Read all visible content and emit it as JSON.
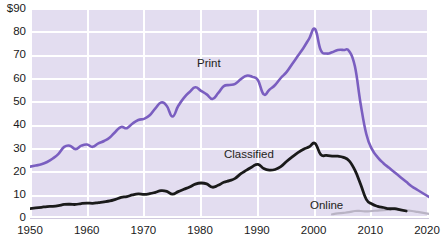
{
  "chart": {
    "title": "",
    "background_color": "#e3ddf0",
    "grid_color": "#ffffff",
    "plot": {
      "left": 30,
      "top": 8,
      "width": 399,
      "height": 210
    }
  },
  "axes": {
    "y_ticks": [
      "$90",
      "80",
      "70",
      "60",
      "50",
      "40",
      "30",
      "20",
      "10",
      "0"
    ],
    "y_values": [
      90,
      80,
      70,
      60,
      50,
      40,
      30,
      20,
      10,
      0
    ],
    "x_ticks": [
      "1950",
      "1960",
      "1970",
      "1980",
      "1990",
      "2000",
      "2010",
      "2020"
    ],
    "x_values": [
      1950,
      1960,
      1970,
      1980,
      1990,
      2000,
      2010,
      2020
    ]
  },
  "annotations": {
    "print": {
      "text": "Print",
      "x": 197,
      "y": 57
    },
    "classified": {
      "text": "Classified",
      "x": 224,
      "y": 148
    },
    "online": {
      "text": "Online",
      "x": 310,
      "y": 199
    }
  },
  "colors": {
    "print": "#7a5ec0",
    "classified": "#1a1a1a",
    "online": "#b9b3c4",
    "background": "#e3ddf0",
    "grid": "#ffffff",
    "text": "#1a1a1a"
  },
  "chart_data": {
    "type": "line",
    "title": "",
    "subtitle": "",
    "xlabel": "",
    "ylabel": "",
    "xlim": [
      1950,
      2020
    ],
    "ylim": [
      0,
      90
    ],
    "grid": true,
    "legend": "inline-labels",
    "y_tick_labels": [
      "$90",
      "80",
      "70",
      "60",
      "50",
      "40",
      "30",
      "20",
      "10",
      "0"
    ],
    "x_tick_labels": [
      "1950",
      "1960",
      "1970",
      "1980",
      "1990",
      "2000",
      "2010",
      "2020"
    ],
    "series": [
      {
        "name": "Print",
        "color": "#7a5ec0",
        "x": [
          1950,
          1951,
          1952,
          1953,
          1954,
          1955,
          1956,
          1957,
          1958,
          1959,
          1960,
          1961,
          1962,
          1963,
          1964,
          1965,
          1966,
          1967,
          1968,
          1969,
          1970,
          1971,
          1972,
          1973,
          1974,
          1975,
          1976,
          1977,
          1978,
          1979,
          1980,
          1981,
          1982,
          1983,
          1984,
          1985,
          1986,
          1987,
          1988,
          1989,
          1990,
          1991,
          1992,
          1993,
          1994,
          1995,
          1996,
          1997,
          1998,
          1999,
          2000,
          2001,
          2002,
          2003,
          2004,
          2005,
          2006,
          2007,
          2008,
          2009,
          2010,
          2011,
          2012,
          2013,
          2014,
          2015,
          2016,
          2017,
          2018,
          2019,
          2020
        ],
        "values": [
          22,
          22.5,
          23,
          24,
          25.5,
          27.5,
          30.5,
          31,
          29.5,
          31,
          31.5,
          30.5,
          32,
          33,
          34.5,
          37,
          39,
          38.5,
          40.5,
          42,
          42.5,
          44,
          47,
          49.5,
          48,
          43.5,
          48,
          51.5,
          54,
          56,
          54.5,
          53,
          51,
          53.5,
          56.5,
          57,
          57.5,
          59.5,
          61,
          60.5,
          59,
          53,
          55,
          57,
          60,
          62.5,
          66,
          69.5,
          73,
          77,
          81,
          72,
          70.5,
          71,
          72,
          72,
          71.5,
          65,
          49,
          36,
          29.5,
          26,
          23.5,
          21.5,
          19.5,
          17.5,
          15.5,
          13.5,
          12,
          10.5,
          9
        ]
      },
      {
        "name": "Classified",
        "color": "#1a1a1a",
        "x": [
          1950,
          1951,
          1952,
          1953,
          1954,
          1955,
          1956,
          1957,
          1958,
          1959,
          1960,
          1961,
          1962,
          1963,
          1964,
          1965,
          1966,
          1967,
          1968,
          1969,
          1970,
          1971,
          1972,
          1973,
          1974,
          1975,
          1976,
          1977,
          1978,
          1979,
          1980,
          1981,
          1982,
          1983,
          1984,
          1985,
          1986,
          1987,
          1988,
          1989,
          1990,
          1991,
          1992,
          1993,
          1994,
          1995,
          1996,
          1997,
          1998,
          1999,
          2000,
          2001,
          2002,
          2003,
          2004,
          2005,
          2006,
          2007,
          2008,
          2009,
          2010,
          2011,
          2012,
          2013,
          2014,
          2015,
          2016
        ],
        "values": [
          4,
          4.3,
          4.6,
          4.9,
          5,
          5.3,
          5.8,
          5.9,
          5.8,
          6.2,
          6.4,
          6.3,
          6.6,
          6.9,
          7.3,
          8,
          8.8,
          9.2,
          9.9,
          10.3,
          10.1,
          10.4,
          11,
          11.7,
          11.4,
          10.2,
          11.3,
          12.3,
          13.3,
          14.5,
          15,
          14.6,
          13.2,
          14,
          15.3,
          16,
          17,
          19,
          20.5,
          22,
          23,
          21.2,
          20.5,
          20.8,
          22,
          24.2,
          26.2,
          28,
          29.5,
          30.5,
          32,
          27.2,
          26.8,
          26.5,
          26.5,
          26,
          24.5,
          20.5,
          14.5,
          8,
          6,
          5,
          4.5,
          4,
          4,
          3.5,
          3
        ]
      },
      {
        "name": "Online",
        "color": "#b9b3c4",
        "x": [
          2003,
          2004,
          2005,
          2006,
          2007,
          2008,
          2009,
          2010,
          2011,
          2012,
          2013,
          2014,
          2015,
          2016,
          2017,
          2018,
          2019,
          2020
        ],
        "values": [
          1.6,
          2.0,
          2.2,
          2.5,
          3.0,
          3.0,
          2.8,
          3.0,
          3.2,
          3.4,
          3.5,
          3.6,
          3.5,
          3.3,
          3.0,
          2.6,
          2.2,
          1.8
        ]
      }
    ]
  }
}
